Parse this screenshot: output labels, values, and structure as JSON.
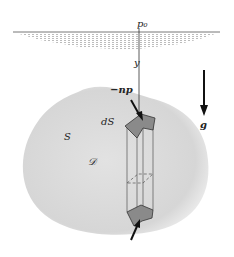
{
  "diagram": {
    "labels": {
      "surface_pressure": "p₀",
      "axis": "y",
      "normal_force": "−np",
      "surface_element": "dS",
      "surface": "S",
      "volume": "𝒟",
      "gravity": "g"
    },
    "colors": {
      "body_fill": "#dcdcdc",
      "element_fill": "#8a8a8a",
      "ink": "#222222",
      "water_hatch": "#9a9a9a"
    }
  }
}
